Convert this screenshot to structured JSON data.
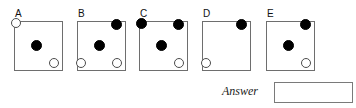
{
  "question": {
    "answer_label": "Answer",
    "answer_value": "",
    "answer_placeholder": ""
  },
  "options": [
    {
      "label": "A",
      "left": 14,
      "dots": [
        {
          "name": "dot-top-left",
          "position": "pos-tl",
          "fill": "hollow",
          "size": 10
        },
        {
          "name": "dot-center",
          "position": "pos-c",
          "fill": "filled",
          "size": 11
        },
        {
          "name": "dot-bottom-right",
          "position": "pos-br",
          "fill": "hollow",
          "size": 10
        }
      ]
    },
    {
      "label": "B",
      "left": 77,
      "dots": [
        {
          "name": "dot-top-right",
          "position": "pos-tr",
          "fill": "filled",
          "size": 11
        },
        {
          "name": "dot-center",
          "position": "pos-c",
          "fill": "filled",
          "size": 11
        },
        {
          "name": "dot-bottom-left",
          "position": "pos-bl",
          "fill": "hollow",
          "size": 10
        },
        {
          "name": "dot-bottom-right",
          "position": "pos-br",
          "fill": "hollow",
          "size": 10
        }
      ]
    },
    {
      "label": "C",
      "left": 139,
      "dots": [
        {
          "name": "dot-top-left",
          "position": "pos-tl",
          "fill": "filled",
          "size": 11
        },
        {
          "name": "dot-top-right",
          "position": "pos-tr",
          "fill": "filled",
          "size": 11
        },
        {
          "name": "dot-center",
          "position": "pos-c",
          "fill": "filled",
          "size": 11
        },
        {
          "name": "dot-bottom-right",
          "position": "pos-br",
          "fill": "hollow",
          "size": 10
        }
      ]
    },
    {
      "label": "D",
      "left": 202,
      "dots": [
        {
          "name": "dot-top-right",
          "position": "pos-tr",
          "fill": "filled",
          "size": 11
        },
        {
          "name": "dot-bottom-left",
          "position": "pos-bl",
          "fill": "hollow",
          "size": 10
        }
      ]
    },
    {
      "label": "E",
      "left": 266,
      "dots": [
        {
          "name": "dot-top-right",
          "position": "pos-tr",
          "fill": "filled",
          "size": 11
        },
        {
          "name": "dot-center",
          "position": "pos-c",
          "fill": "filled",
          "size": 11
        },
        {
          "name": "dot-bottom-right",
          "position": "pos-br",
          "fill": "hollow",
          "size": 10
        }
      ]
    }
  ],
  "colors": {
    "dot_filled": "#000000",
    "dot_hollow_stroke": "#4c4c4c",
    "box_border": "#6e6e6e",
    "answer_box_border": "#7a7a7a",
    "background": "#ffffff",
    "text": "#111111"
  }
}
